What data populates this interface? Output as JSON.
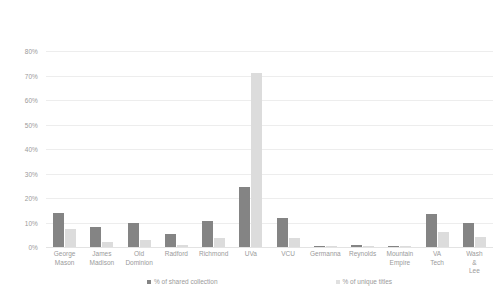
{
  "chart_data": {
    "type": "bar",
    "title": "",
    "xlabel": "",
    "ylabel": "",
    "ylim": [
      0,
      80
    ],
    "ytick_labels": [
      "80%",
      "70%",
      "60%",
      "50%",
      "40%",
      "30%",
      "20%",
      "10%",
      "0%"
    ],
    "ytick_values": [
      80,
      70,
      60,
      50,
      40,
      30,
      20,
      10,
      0
    ],
    "grid": true,
    "legend_position": "bottom",
    "categories": [
      "George Mason",
      "James Madison",
      "Old Dominion",
      "Radford",
      "Richmond",
      "UVa",
      "VCU",
      "Germanna",
      "Reynolds",
      "Mountain Empire",
      "VA Tech",
      "Wash & Lee"
    ],
    "series": [
      {
        "name": "% of shared collection",
        "color": "#848484",
        "values": [
          14,
          8,
          10,
          5.5,
          10.5,
          24.5,
          12,
          0.5,
          1,
          0.5,
          13.5,
          10
        ]
      },
      {
        "name": "% of unique titles",
        "color": "#dcdcdc",
        "values": [
          7.5,
          2,
          3,
          1,
          3.5,
          71,
          3.5,
          0.5,
          0.5,
          0.5,
          6,
          4
        ]
      }
    ]
  },
  "legend": {
    "items": [
      {
        "label": "% of shared collection",
        "swatch": "shared"
      },
      {
        "label": "% of unique titles",
        "swatch": "unique"
      }
    ]
  }
}
